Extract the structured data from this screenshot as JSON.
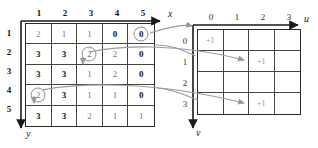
{
  "figure": {
    "accent_gray": "#9a9a9a",
    "grid_line": "#444444"
  },
  "left_grid": {
    "name": "source-grid",
    "x_axis_label": "x",
    "y_axis_label": "y",
    "col_headers": [
      "1",
      "2",
      "3",
      "4",
      "5"
    ],
    "row_headers": [
      "1",
      "2",
      "3",
      "4",
      "5"
    ],
    "rows": [
      [
        "2",
        "1",
        "1",
        "0",
        "0"
      ],
      [
        "3",
        "3",
        "2",
        "2",
        "0"
      ],
      [
        "3",
        "3",
        "1",
        "2",
        "0"
      ],
      [
        "2",
        "3",
        "1",
        "1",
        "0"
      ],
      [
        "3",
        "3",
        "2",
        "1",
        "1"
      ]
    ],
    "bold_cells": [
      [
        0,
        3
      ],
      [
        0,
        4
      ],
      [
        1,
        0
      ],
      [
        1,
        1
      ],
      [
        1,
        4
      ],
      [
        2,
        0
      ],
      [
        2,
        1
      ],
      [
        2,
        4
      ],
      [
        3,
        1
      ],
      [
        3,
        4
      ],
      [
        4,
        0
      ],
      [
        4,
        1
      ]
    ],
    "circled_cells": [
      {
        "row": 0,
        "col": 4,
        "value": "0"
      },
      {
        "row": 1,
        "col": 2,
        "value": "2"
      },
      {
        "row": 3,
        "col": 0,
        "value": "2"
      }
    ]
  },
  "right_grid": {
    "name": "accumulator-grid",
    "u_axis_label": "u",
    "v_axis_label": "v",
    "col_headers": [
      "0",
      "1",
      "2",
      "3"
    ],
    "row_headers": [
      "0",
      "1",
      "2",
      "3"
    ],
    "rows": [
      [
        "+1",
        "",
        "",
        ""
      ],
      [
        "",
        "",
        "+1",
        ""
      ],
      [
        "",
        "",
        "",
        ""
      ],
      [
        "",
        "",
        "+1",
        ""
      ]
    ]
  }
}
